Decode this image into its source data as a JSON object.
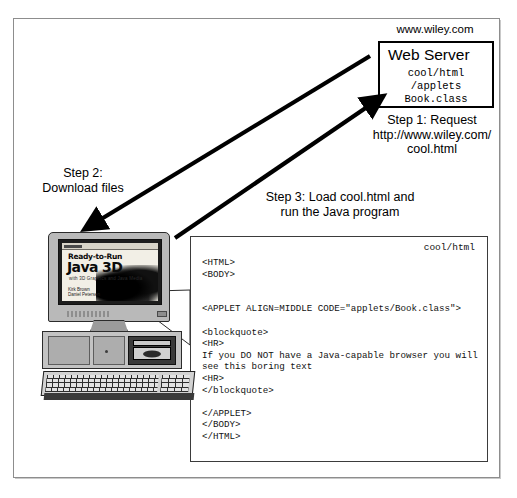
{
  "diagram": {
    "server": {
      "url_label": "www.wiley.com",
      "box_title": "Web Server",
      "paths": "cool/html\n/applets\nBook.class"
    },
    "steps": {
      "step1": "Step 1: Request\nhttp://www.wiley.com/\ncool.html",
      "step2": "Step 2:\nDownload files",
      "step3": "Step 3: Load cool.html and\nrun the Java program"
    },
    "code_box": {
      "caption": "cool/html",
      "lines": [
        "<HTML>",
        "<BODY>",
        "",
        "",
        "<APPLET ALIGN=MIDDLE CODE=\"applets/Book.class\">",
        "",
        "<blockquote>",
        "<HR>",
        "If you DO NOT have a Java-capable browser you will see this boring text",
        "<HR>",
        "</blockquote>",
        "",
        "</APPLET>",
        "</BODY>",
        "</HTML>"
      ]
    },
    "computer": {
      "screen": {
        "book_line1": "Ready-to-Run",
        "book_line2": "Java 3D",
        "book_subtitle": "with 3D Graphics and Java Media",
        "book_authors": "Kirk Brown\nDaniel Petersen"
      }
    },
    "colors": {
      "ink": "#000000",
      "frame": "#8d8d8d",
      "monitor_case": "#b9b9b9",
      "screen_bg": "#f2efe6",
      "code_border": "#3b3b3b"
    },
    "icons": {
      "arrow_request": "arrow-up-right",
      "arrow_download": "arrow-down-left",
      "callout": "callout-pointer"
    }
  }
}
